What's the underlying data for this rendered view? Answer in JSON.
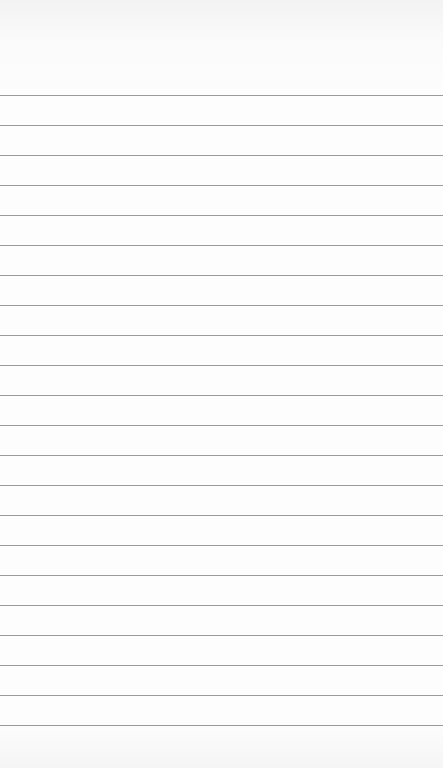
{
  "page": {
    "type": "blank-lined-paper",
    "line_color": "#9a9a9a",
    "background_color": "#fdfdfd",
    "first_line_y": 95,
    "line_spacing": 30,
    "line_count": 22
  }
}
